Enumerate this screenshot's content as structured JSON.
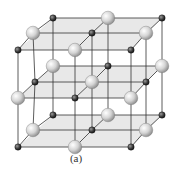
{
  "figure": {
    "caption": "(a)",
    "colors": {
      "plane_fill": "#d9d9d9",
      "bond_line": "#333333",
      "large_ion": "#cfcfcf",
      "small_ion": "#3a3a3a"
    },
    "layers": [
      {
        "name": "top",
        "atoms": [
          {
            "x": 53,
            "y": 18,
            "type": "small"
          },
          {
            "x": 108,
            "y": 18,
            "type": "large"
          },
          {
            "x": 162,
            "y": 18,
            "type": "small"
          },
          {
            "x": 33,
            "y": 33,
            "type": "large"
          },
          {
            "x": 92,
            "y": 33,
            "type": "small"
          },
          {
            "x": 146,
            "y": 33,
            "type": "large"
          },
          {
            "x": 18,
            "y": 50,
            "type": "small"
          },
          {
            "x": 75,
            "y": 50,
            "type": "large"
          },
          {
            "x": 131,
            "y": 50,
            "type": "small"
          }
        ]
      },
      {
        "name": "middle",
        "atoms": [
          {
            "x": 53,
            "y": 66,
            "type": "large"
          },
          {
            "x": 108,
            "y": 66,
            "type": "small"
          },
          {
            "x": 162,
            "y": 66,
            "type": "large"
          },
          {
            "x": 35,
            "y": 82,
            "type": "small"
          },
          {
            "x": 92,
            "y": 82,
            "type": "large"
          },
          {
            "x": 146,
            "y": 82,
            "type": "small"
          },
          {
            "x": 18,
            "y": 98,
            "type": "large"
          },
          {
            "x": 75,
            "y": 98,
            "type": "small"
          },
          {
            "x": 131,
            "y": 98,
            "type": "large"
          }
        ]
      },
      {
        "name": "bottom",
        "atoms": [
          {
            "x": 53,
            "y": 115,
            "type": "small"
          },
          {
            "x": 108,
            "y": 115,
            "type": "large"
          },
          {
            "x": 162,
            "y": 115,
            "type": "small"
          },
          {
            "x": 33,
            "y": 130,
            "type": "large"
          },
          {
            "x": 92,
            "y": 130,
            "type": "small"
          },
          {
            "x": 146,
            "y": 130,
            "type": "large"
          },
          {
            "x": 18,
            "y": 147,
            "type": "small"
          },
          {
            "x": 75,
            "y": 147,
            "type": "large"
          },
          {
            "x": 131,
            "y": 147,
            "type": "small"
          }
        ]
      }
    ]
  }
}
